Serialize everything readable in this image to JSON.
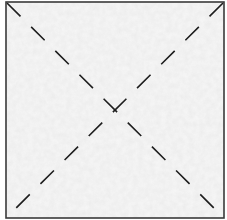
{
  "diagram": {
    "type": "square-with-dashed-diagonals",
    "frame": {
      "x": 6,
      "y": 2,
      "width": 218,
      "height": 216
    },
    "colors": {
      "fill_base": "#ececec",
      "fill_mottle_light": "#f6f6f6",
      "fill_mottle_dark": "#dedede",
      "border": "#3a3a3a",
      "dash_line": "#1e1e1e"
    },
    "diagonals": [
      {
        "name": "top-left-to-bottom-right",
        "x1": 7,
        "y1": 3,
        "x2": 223,
        "y2": 217
      },
      {
        "name": "top-right-to-bottom-left",
        "x1": 223,
        "y1": 3,
        "x2": 7,
        "y2": 217
      }
    ],
    "dash_pattern": "19 15",
    "intersection": {
      "x": 115,
      "y": 110
    }
  }
}
